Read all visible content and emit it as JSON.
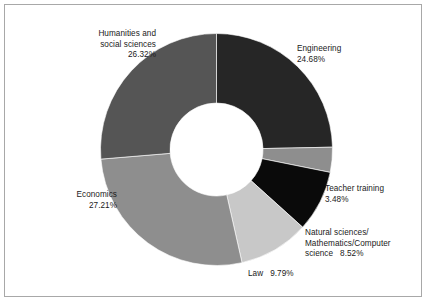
{
  "figure": {
    "background_color": "#ffffff",
    "frame_color": "#a8a8a8",
    "text_color": "#1a1a1a"
  },
  "chart_data": {
    "type": "pie",
    "variant": "donut",
    "title": "",
    "subtitle": "",
    "xlabel": "",
    "ylabel": "",
    "legend_position": "none",
    "grid": false,
    "labels_placement": "outside-callout-free",
    "start_angle_deg": 0,
    "direction": "clockwise",
    "inner_radius_ratio": 0.4,
    "center_x": 216.5,
    "center_y": 149.5,
    "outer_radius": 116,
    "inner_radius": 46.5,
    "categories": [
      "Engineering",
      "Teacher training",
      "Natural sciences/Mathematics/Computer science",
      "Law",
      "Economics",
      "Humanities and social sciences"
    ],
    "values": [
      24.68,
      3.48,
      8.52,
      9.79,
      27.21,
      26.32
    ],
    "value_suffix": "%",
    "colors": [
      "#262626",
      "#8e8e8e",
      "#0a0a0a",
      "#c8c8c8",
      "#8e8e8e",
      "#555555"
    ],
    "slices": [
      {
        "name": "engineering",
        "label_lines": [
          "Engineering",
          "24.68%"
        ],
        "value": 24.68,
        "value_text": "24.68%",
        "color": "#262626"
      },
      {
        "name": "teacher-training",
        "label_lines": [
          "Teacher training",
          "3.48%"
        ],
        "value": 3.48,
        "value_text": "3.48%",
        "color": "#8e8e8e"
      },
      {
        "name": "natural-sciences",
        "label_lines": [
          "Natural sciences/",
          "Mathematics/Computer",
          "science   8.52%"
        ],
        "value": 8.52,
        "value_text": "8.52%",
        "color": "#0a0a0a"
      },
      {
        "name": "law",
        "label_lines": [
          "Law   9.79%"
        ],
        "value": 9.79,
        "value_text": "9.79%",
        "color": "#c8c8c8"
      },
      {
        "name": "economics",
        "label_lines": [
          "Economics",
          "27.21%"
        ],
        "value": 27.21,
        "value_text": "27.21%",
        "color": "#8e8e8e"
      },
      {
        "name": "humanities",
        "label_lines": [
          "Humanities and",
          "social sciences",
          "26.32%"
        ],
        "value": 26.32,
        "value_text": "26.32%",
        "color": "#555555"
      }
    ]
  },
  "labels": {
    "humanities": "Humanities and\nsocial sciences\n26.32%",
    "engineering": "Engineering\n24.68%",
    "teacher_training": "Teacher training\n3.48%",
    "natural_sciences": "Natural sciences/\nMathematics/Computer\nscience   8.52%",
    "law": "Law   9.79%",
    "economics": "Economics\n27.21%"
  }
}
